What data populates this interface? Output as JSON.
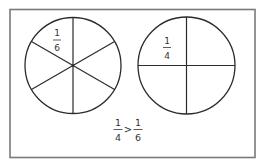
{
  "figure": {
    "frame": {
      "x": 10,
      "y": 9.5,
      "width": 245,
      "height": 148,
      "stroke": "#7a7a7a"
    },
    "line_color": "#2b2b2b",
    "text_color": "#333333"
  },
  "circles": [
    {
      "id": "sixths",
      "cx": 73,
      "cy": 65.5,
      "r": 48,
      "divisions": 6,
      "label": {
        "numerator": "1",
        "denominator": "6",
        "x": 57,
        "y_num": 33,
        "y_bar": 40,
        "y_den": 47.5
      }
    },
    {
      "id": "quarters",
      "cx": 186.5,
      "cy": 65.5,
      "r": 48.5,
      "divisions": 4,
      "label": {
        "numerator": "1",
        "denominator": "4",
        "x": 167,
        "y_num": 41,
        "y_bar": 47.5,
        "y_den": 55.5
      }
    }
  ],
  "comparison": {
    "left": {
      "numerator": "1",
      "denominator": "4",
      "x": 118
    },
    "operator": ">",
    "operator_x": 128,
    "right": {
      "numerator": "1",
      "denominator": "6",
      "x": 138
    },
    "y_num": 123,
    "y_bar": 129.5,
    "y_den": 137.5
  }
}
